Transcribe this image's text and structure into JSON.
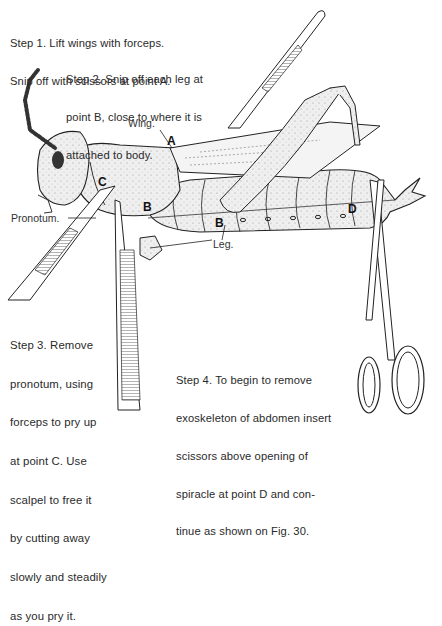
{
  "steps": {
    "step1": {
      "line1": "Step 1. Lift wings with forceps.",
      "line2": "Snip off with scissors at point A."
    },
    "step2": {
      "line1": "Step 2. Snip off each leg at",
      "line2": "point B, close to where it is",
      "line3": "attached to body."
    },
    "step3": {
      "line1": "Step 3. Remove",
      "line2": "pronotum, using",
      "line3": "forceps to pry up",
      "line4": "at point C. Use",
      "line5": "scalpel to free it",
      "line6": "by cutting away",
      "line7": "slowly and steadily",
      "line8": "as you pry it."
    },
    "step4": {
      "line1": "Step 4. To begin to remove",
      "line2": "exoskeleton of abdomen insert",
      "line3": "scissors above opening of",
      "line4": "spiracle at point D and con-",
      "line5": "tinue as shown on Fig. 30."
    }
  },
  "labels": {
    "wing": "Wing.",
    "pronotum": "Pronotum.",
    "leg": "Leg."
  },
  "points": {
    "a": "A",
    "b1": "B",
    "b2": "B",
    "c": "C",
    "d": "D"
  },
  "colors": {
    "ink": "#2a2a2a",
    "body_fill": "#ececec",
    "paper": "#ffffff"
  }
}
